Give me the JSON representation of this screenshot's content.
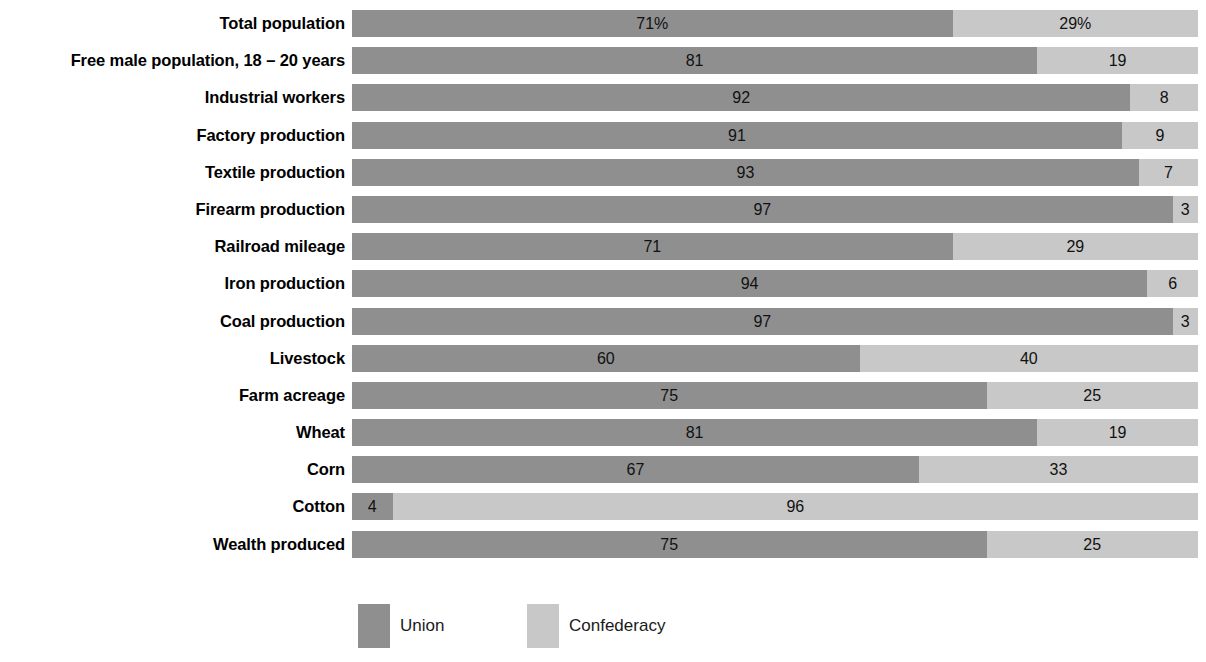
{
  "chart_data": {
    "type": "bar",
    "orientation": "horizontal",
    "stacked": true,
    "normalized": true,
    "title": "",
    "subtitle": "",
    "xlabel": "",
    "ylabel": "",
    "xlim": [
      0,
      100
    ],
    "grid": false,
    "legend_position": "bottom-left",
    "categories": [
      "Total population",
      "Free male population, 18 – 20 years",
      "Industrial workers",
      "Factory production",
      "Textile production",
      "Firearm production",
      "Railroad mileage",
      "Iron production",
      "Coal production",
      "Livestock",
      "Farm acreage",
      "Wheat",
      "Corn",
      "Cotton",
      "Wealth produced"
    ],
    "series": [
      {
        "name": "Union",
        "color": "#8f8f8f",
        "values": [
          71,
          81,
          92,
          91,
          93,
          97,
          71,
          94,
          97,
          60,
          75,
          81,
          67,
          4,
          75
        ],
        "labels": [
          "71%",
          "81",
          "92",
          "91",
          "93",
          "97",
          "71",
          "94",
          "97",
          "60",
          "75",
          "81",
          "67",
          "4",
          "75"
        ]
      },
      {
        "name": "Confederacy",
        "color": "#c8c8c8",
        "values": [
          29,
          19,
          8,
          9,
          7,
          3,
          29,
          6,
          3,
          40,
          25,
          19,
          33,
          96,
          25
        ],
        "labels": [
          "29%",
          "19",
          "8",
          "9",
          "7",
          "3",
          "29",
          "6",
          "3",
          "40",
          "25",
          "19",
          "33",
          "96",
          "25"
        ]
      }
    ]
  },
  "rows": [
    {
      "label": "Total population",
      "union": 71,
      "conf": 29,
      "union_label": "71%",
      "conf_label": "29%",
      "union_min": 71
    },
    {
      "label": "Free male population, 18 – 20 years",
      "union": 81,
      "conf": 19,
      "union_label": "81",
      "conf_label": "19",
      "union_min": 81
    },
    {
      "label": "Industrial workers",
      "union": 92,
      "conf": 8,
      "union_label": "92",
      "conf_label": "8",
      "union_min": 92
    },
    {
      "label": "Factory production",
      "union": 91,
      "conf": 9,
      "union_label": "91",
      "conf_label": "9",
      "union_min": 91
    },
    {
      "label": "Textile production",
      "union": 93,
      "conf": 7,
      "union_label": "93",
      "conf_label": "7",
      "union_min": 93
    },
    {
      "label": "Firearm production",
      "union": 97,
      "conf": 3,
      "union_label": "97",
      "conf_label": "3",
      "union_min": 97
    },
    {
      "label": "Railroad mileage",
      "union": 71,
      "conf": 29,
      "union_label": "71",
      "conf_label": "29",
      "union_min": 71
    },
    {
      "label": "Iron production",
      "union": 94,
      "conf": 6,
      "union_label": "94",
      "conf_label": "6",
      "union_min": 94
    },
    {
      "label": "Coal production",
      "union": 97,
      "conf": 3,
      "union_label": "97",
      "conf_label": "3",
      "union_min": 97
    },
    {
      "label": "Livestock",
      "union": 60,
      "conf": 40,
      "union_label": "60",
      "conf_label": "40",
      "union_min": 60
    },
    {
      "label": "Farm acreage",
      "union": 75,
      "conf": 25,
      "union_label": "75",
      "conf_label": "25",
      "union_min": 75
    },
    {
      "label": "Wheat",
      "union": 81,
      "conf": 19,
      "union_label": "81",
      "conf_label": "19",
      "union_min": 81
    },
    {
      "label": "Corn",
      "union": 67,
      "conf": 33,
      "union_label": "67",
      "conf_label": "33",
      "union_min": 67
    },
    {
      "label": "Cotton",
      "union": 4,
      "conf": 96,
      "union_label": "4",
      "conf_label": "96",
      "union_min": 4.8
    },
    {
      "label": "Wealth produced",
      "union": 75,
      "conf": 25,
      "union_label": "75",
      "conf_label": "25",
      "union_min": 75
    }
  ],
  "legend": {
    "items": [
      {
        "name": "union",
        "label": "Union",
        "color": "#8f8f8f"
      },
      {
        "name": "confederacy",
        "label": "Confederacy",
        "color": "#c8c8c8"
      }
    ]
  }
}
